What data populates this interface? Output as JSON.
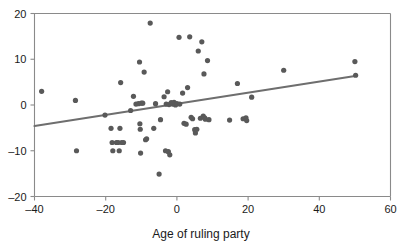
{
  "chart_data": {
    "type": "scatter",
    "title": "",
    "subtitle": "",
    "xlabel": "Age of ruling party",
    "ylabel": "",
    "xlim": [
      -40,
      60
    ],
    "ylim": [
      -20,
      20
    ],
    "xticks": [
      -40,
      -20,
      0,
      20,
      40,
      60
    ],
    "yticks": [
      -20,
      -10,
      0,
      10,
      20
    ],
    "xtick_labels": [
      "-40",
      "-20",
      "0",
      "20",
      "40",
      "60"
    ],
    "ytick_labels": [
      "-20",
      "-10",
      "0",
      "10",
      "20"
    ],
    "grid": false,
    "legend": "none",
    "point_color": "#595959",
    "line_color": "#6e6e6e",
    "axis_color": "#8a8a8a",
    "text_color": "#1a1a1a",
    "background_color": "#ffffff",
    "point_radius": 2.6,
    "series": [
      {
        "name": "observations",
        "points": [
          [
            -38.0,
            3.0
          ],
          [
            -28.5,
            1.0
          ],
          [
            -28.2,
            -10.0
          ],
          [
            -20.2,
            -2.2
          ],
          [
            -18.5,
            -5.1
          ],
          [
            -18.2,
            -8.2
          ],
          [
            -18.0,
            -10.0
          ],
          [
            -17.0,
            -8.2
          ],
          [
            -16.5,
            -8.2
          ],
          [
            -16.2,
            -10.0
          ],
          [
            -16.0,
            -5.1
          ],
          [
            -15.8,
            4.9
          ],
          [
            -15.5,
            -8.2
          ],
          [
            -15.0,
            -8.2
          ],
          [
            -13.0,
            -1.2
          ],
          [
            -12.2,
            1.9
          ],
          [
            -11.5,
            0.2
          ],
          [
            -10.8,
            0.3
          ],
          [
            -10.5,
            9.4
          ],
          [
            -10.4,
            -4.1
          ],
          [
            -10.3,
            -5.3
          ],
          [
            -10.2,
            -10.5
          ],
          [
            -10.0,
            0.4
          ],
          [
            -9.6,
            0.4
          ],
          [
            -9.2,
            7.2
          ],
          [
            -8.8,
            -7.6
          ],
          [
            -8.5,
            -7.4
          ],
          [
            -7.5,
            17.9
          ],
          [
            -6.5,
            -5.1
          ],
          [
            -6.0,
            0.3
          ],
          [
            -5.0,
            -15.1
          ],
          [
            -4.6,
            -3.2
          ],
          [
            -3.6,
            1.8
          ],
          [
            -3.2,
            -10.0
          ],
          [
            -3.0,
            0.2
          ],
          [
            -2.6,
            2.9
          ],
          [
            -2.4,
            -10.2
          ],
          [
            -2.2,
            0.1
          ],
          [
            -2.0,
            -10.9
          ],
          [
            -1.6,
            0.5
          ],
          [
            -1.2,
            0.2
          ],
          [
            -0.8,
            0.6
          ],
          [
            -0.4,
            0.0
          ],
          [
            0.0,
            0.3
          ],
          [
            0.6,
            14.8
          ],
          [
            0.8,
            0.2
          ],
          [
            1.6,
            2.6
          ],
          [
            2.0,
            -4.0
          ],
          [
            2.6,
            -4.2
          ],
          [
            3.0,
            3.8
          ],
          [
            3.6,
            14.9
          ],
          [
            4.0,
            -2.7
          ],
          [
            4.4,
            -3.0
          ],
          [
            5.0,
            -5.4
          ],
          [
            5.2,
            -6.1
          ],
          [
            5.6,
            -5.3
          ],
          [
            6.0,
            11.8
          ],
          [
            6.6,
            -2.9
          ],
          [
            7.0,
            13.8
          ],
          [
            7.4,
            -2.4
          ],
          [
            7.6,
            6.8
          ],
          [
            7.8,
            -2.8
          ],
          [
            8.0,
            -3.1
          ],
          [
            8.6,
            9.7
          ],
          [
            9.0,
            -3.2
          ],
          [
            14.8,
            -3.3
          ],
          [
            17.0,
            4.7
          ],
          [
            18.6,
            -3.0
          ],
          [
            19.4,
            -2.8
          ],
          [
            19.6,
            -3.4
          ],
          [
            21.0,
            1.7
          ],
          [
            30.0,
            7.6
          ],
          [
            50.0,
            9.5
          ],
          [
            50.2,
            6.5
          ]
        ]
      }
    ],
    "trend_line": {
      "name": "fitted regression line",
      "x_start": -40,
      "y_start": -4.6,
      "x_end": 50.5,
      "y_end": 6.4
    }
  }
}
